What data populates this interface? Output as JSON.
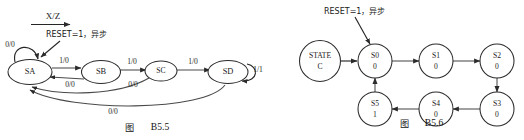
{
  "page": {
    "background": "#ffffff",
    "width": 524,
    "height": 140
  },
  "figures": [
    {
      "id": "fig-b5-5",
      "caption_cjk": "图",
      "caption_label": "B5.5",
      "legend": {
        "label": "X/Z",
        "note": "arrow-under-label-legend"
      },
      "annotation": "RESET=1，异步",
      "type": "mealy-state-diagram",
      "states": [
        {
          "name": "SA",
          "cx": 30,
          "cy": 72
        },
        {
          "name": "SB",
          "cx": 101,
          "cy": 72
        },
        {
          "name": "SC",
          "cx": 161,
          "cy": 72
        },
        {
          "name": "SD",
          "cx": 228,
          "cy": 72
        }
      ],
      "transitions": [
        {
          "from": "SA",
          "to": "SA",
          "label": "0/0",
          "kind": "self-loop-top-left"
        },
        {
          "from": "SA",
          "to": "SB",
          "label": "1/0",
          "kind": "forward"
        },
        {
          "from": "SB",
          "to": "SA",
          "label": "0/0",
          "kind": "back"
        },
        {
          "from": "SB",
          "to": "SC",
          "label": "1/0",
          "kind": "forward"
        },
        {
          "from": "SC",
          "to": "SA",
          "label": "0/0",
          "kind": "long-back"
        },
        {
          "from": "SC",
          "to": "SD",
          "label": "1/0",
          "kind": "forward"
        },
        {
          "from": "SD",
          "to": "SD",
          "label": "1/1",
          "kind": "self-loop-right"
        },
        {
          "from": "SD",
          "to": "SA",
          "label": "0/0",
          "kind": "long-back-bottom"
        }
      ]
    },
    {
      "id": "fig-b5-6",
      "caption_cjk": "图",
      "caption_label": "B5.6",
      "annotation": "RESET=1，异步",
      "type": "moore-state-diagram",
      "states": [
        {
          "name": "STATE",
          "output": "C",
          "cx": 320,
          "cy": 61,
          "kind": "legend-node"
        },
        {
          "name": "S0",
          "output": "0",
          "cx": 375,
          "cy": 61
        },
        {
          "name": "S1",
          "output": "0",
          "cx": 436,
          "cy": 61
        },
        {
          "name": "S2",
          "output": "0",
          "cx": 497,
          "cy": 61
        },
        {
          "name": "S3",
          "output": "0",
          "cx": 497,
          "cy": 109
        },
        {
          "name": "S4",
          "output": "0",
          "cx": 436,
          "cy": 109
        },
        {
          "name": "S5",
          "output": "1",
          "cx": 375,
          "cy": 109
        }
      ],
      "transitions": [
        {
          "from": "STATE",
          "to": "S0",
          "kind": "short-right"
        },
        {
          "from": "S0",
          "to": "S1",
          "kind": "right"
        },
        {
          "from": "S1",
          "to": "S2",
          "kind": "right"
        },
        {
          "from": "S2",
          "to": "S3",
          "kind": "down"
        },
        {
          "from": "S3",
          "to": "S4",
          "kind": "left"
        },
        {
          "from": "S4",
          "to": "S5",
          "kind": "left"
        },
        {
          "from": "S5",
          "to": "S0",
          "kind": "up"
        }
      ]
    }
  ]
}
